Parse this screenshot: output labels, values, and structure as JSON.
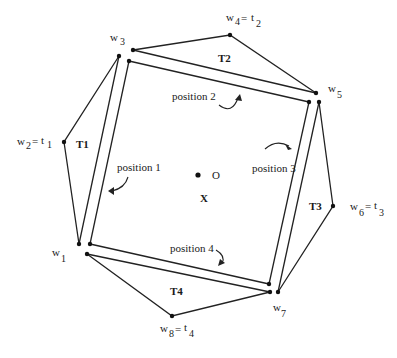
{
  "diagram": {
    "vertices": {
      "w1": "w",
      "w1_sub": "1",
      "w2": "w",
      "w2_sub": "2",
      "w2_eq": "=",
      "t1": "t",
      "t1_sub": "1",
      "w3": "w",
      "w3_sub": "3",
      "w4": "w",
      "w4_sub": "4",
      "w4_eq": "=",
      "t2": "t",
      "t2_sub": "2",
      "w5": "w",
      "w5_sub": "5",
      "w6": "w",
      "w6_sub": "6",
      "w6_eq": "=",
      "t3": "t",
      "t3_sub": "3",
      "w7": "w",
      "w7_sub": "7",
      "w8": "w",
      "w8_sub": "8",
      "w8_eq": "=",
      "t4": "t",
      "t4_sub": "4"
    },
    "triangles": [
      "T1",
      "T2",
      "T3",
      "T4"
    ],
    "positions": [
      "position 1",
      "position 2",
      "position 3",
      "position 4"
    ],
    "center_label": "O",
    "region_label": "X"
  }
}
